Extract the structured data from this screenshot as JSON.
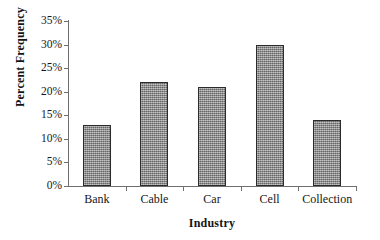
{
  "chart_data": {
    "type": "bar",
    "title": "",
    "categories": [
      "Bank",
      "Cable",
      "Car",
      "Cell",
      "Collection"
    ],
    "values": [
      13,
      22,
      21,
      30,
      14
    ],
    "value_labels": [
      "13%",
      "22%",
      "21%",
      "30%",
      "14%"
    ],
    "xlabel": "Industry",
    "ylabel": "Percent Frequency",
    "ylim": [
      0,
      35
    ],
    "ytick_values": [
      0,
      5,
      10,
      15,
      20,
      25,
      30,
      35
    ],
    "ytick_labels": [
      "0%",
      "5%",
      "10%",
      "15%",
      "20%",
      "25%",
      "30%",
      "35%"
    ],
    "grid": false,
    "legend": false,
    "legend_position": "none",
    "bar_color": "#8d8d8d",
    "bar_border_color": "#2b2b2b",
    "axis_color": "#6f6f6f",
    "background_color": "#ffffff",
    "text_color": "#171717"
  }
}
